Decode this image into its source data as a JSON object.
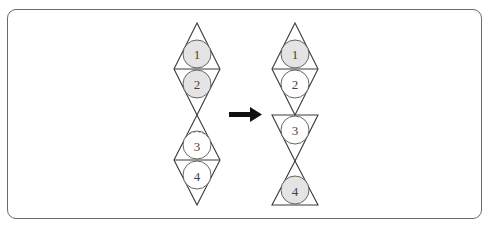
{
  "colors": {
    "frame": "#6a6a6a",
    "edge": "#3a3a3a",
    "shaded_fill": "#e4e4e4",
    "plain_fill": "#ffffff",
    "arrow": "#111111"
  },
  "left_figure": {
    "description": "Two stacked rhombi, each split into two triangles with an inscribed circle",
    "circles": [
      {
        "label": "1",
        "shaded": true
      },
      {
        "label": "2",
        "shaded": true
      },
      {
        "label": "3",
        "shaded": false,
        "dashed_top_arc": true
      },
      {
        "label": "4",
        "shaded": false
      }
    ]
  },
  "arrow": {
    "direction": "right"
  },
  "right_figure": {
    "description": "Top rhombus retained; bottom rhombus halves separated into inverted and upright triangles meeting at a vertex",
    "circles": [
      {
        "label": "1",
        "shaded": true
      },
      {
        "label": "2",
        "shaded": false
      },
      {
        "label": "3",
        "shaded": false
      },
      {
        "label": "4",
        "shaded": true
      }
    ]
  }
}
